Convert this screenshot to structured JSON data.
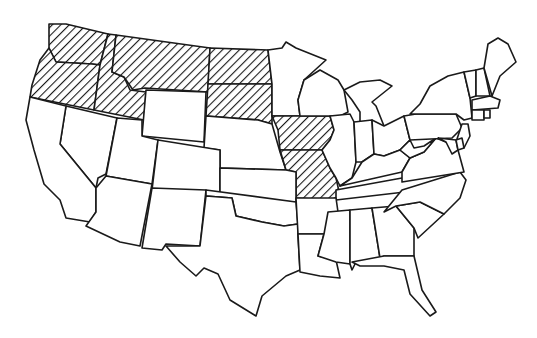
{
  "map": {
    "title": "United States map with highlighted states",
    "colors": {
      "background": "#ffffff",
      "border": "#1a1a1a",
      "hatch": "#1a1a1a",
      "fill": "#ffffff"
    },
    "pattern": "diagonal-hatch",
    "highlighted_states": [
      "WA",
      "OR",
      "ID",
      "MT",
      "ND",
      "SD",
      "IA",
      "MO"
    ],
    "states": [
      {
        "id": "WA",
        "name": "Washington",
        "points": "49,24 66,24 108,34 100,65 92,64 56,62 49,48"
      },
      {
        "id": "OR",
        "name": "Oregon",
        "points": "49,48 56,62 92,64 100,65 98,80 94,110 30,97 32,85 40,60"
      },
      {
        "id": "ID",
        "name": "Idaho",
        "points": "108,34 116,35 112,72 124,77 130,90 146,92 144,120 94,110 98,80 100,65"
      },
      {
        "id": "MT",
        "name": "Montana",
        "points": "116,35 210,48 208,92 145,88 133,90 124,77 112,72"
      },
      {
        "id": "ND",
        "name": "North Dakota",
        "points": "210,48 268,50 272,84 208,84"
      },
      {
        "id": "SD",
        "name": "South Dakota",
        "points": "208,84 272,84 272,124 258,120 206,116"
      },
      {
        "id": "WY",
        "name": "Wyoming",
        "points": "146,90 206,92 204,142 142,136"
      },
      {
        "id": "NE",
        "name": "Nebraska",
        "points": "206,116 258,120 272,124 280,152 286,170 220,168 220,150 204,148"
      },
      {
        "id": "MN",
        "name": "Minnesota",
        "points": "268,50 282,48 286,42 296,48 326,60 304,80 298,100 300,116 272,116 272,84"
      },
      {
        "id": "IA",
        "name": "Iowa",
        "points": "272,116 330,116 334,130 330,140 322,150 280,150 278,130"
      },
      {
        "id": "MO",
        "name": "Missouri",
        "points": "280,150 322,150 330,168 336,178 340,196 330,200 296,198 296,172 286,170"
      },
      {
        "id": "WI",
        "name": "Wisconsin",
        "points": "304,80 320,70 338,80 344,90 348,112 340,116 330,116 300,116 298,100"
      },
      {
        "id": "IL",
        "name": "Illinois",
        "points": "330,116 350,114 354,122 356,162 352,178 340,186 336,178 330,168 322,150 330,140 334,130"
      },
      {
        "id": "MI",
        "name": "Michigan",
        "points": "344,90 360,82 380,80 392,86 372,102 376,106 384,126 360,128 360,112 352,100"
      },
      {
        "id": "IN",
        "name": "Indiana",
        "points": "354,122 372,120 374,154 362,162 356,162"
      },
      {
        "id": "OH",
        "name": "Ohio",
        "points": "372,120 384,126 404,116 410,140 400,150 384,156 374,154"
      },
      {
        "id": "KY",
        "name": "Kentucky",
        "points": "352,178 362,162 374,154 384,156 400,150 410,158 402,172 340,186"
      },
      {
        "id": "TN",
        "name": "Tennessee",
        "points": "336,190 402,178 460,172 446,180 422,190 336,200"
      },
      {
        "id": "NV",
        "name": "Nevada",
        "points": "66,106 117,118 106,174 98,178 96,188 60,144"
      },
      {
        "id": "CA",
        "name": "California",
        "points": "30,97 66,106 60,144 96,188 96,212 90,222 66,218 60,200 44,184 34,150 26,120"
      },
      {
        "id": "UT",
        "name": "Utah",
        "points": "117,118 142,120 142,136 158,140 152,184 106,176"
      },
      {
        "id": "CO",
        "name": "Colorado",
        "points": "158,140 220,150 220,196 152,190"
      },
      {
        "id": "AZ",
        "name": "Arizona",
        "points": "106,176 152,184 140,246 120,242 86,226 96,212 96,188"
      },
      {
        "id": "NM",
        "name": "New Mexico",
        "points": "152,188 206,190 200,246 166,244 162,250 142,248"
      },
      {
        "id": "KS",
        "name": "Kansas",
        "points": "220,168 286,170 296,172 296,202 220,198"
      },
      {
        "id": "OK",
        "name": "Oklahoma",
        "points": "206,190 296,202 298,224 284,226 262,222 236,216 232,198 206,196"
      },
      {
        "id": "TX",
        "name": "Texas",
        "points": "206,196 232,198 236,216 262,222 284,226 298,224 298,236 300,270 286,276 262,296 256,316 230,300 218,274 204,268 196,276 180,262 166,246 200,246"
      },
      {
        "id": "AR",
        "name": "Arkansas",
        "points": "296,198 336,198 338,212 328,232 324,234 298,234"
      },
      {
        "id": "LA",
        "name": "Louisiana",
        "points": "298,234 324,234 318,256 336,260 340,278 320,276 300,272"
      },
      {
        "id": "MS",
        "name": "Mississippi",
        "points": "328,212 350,210 350,264 336,262 318,256 324,234"
      },
      {
        "id": "AL",
        "name": "Alabama",
        "points": "350,210 372,208 380,258 356,262 352,270 350,264"
      },
      {
        "id": "GA",
        "name": "Georgia",
        "points": "372,208 396,206 414,228 414,256 384,256 380,258"
      },
      {
        "id": "FL",
        "name": "Florida",
        "points": "352,262 384,256 414,256 422,290 436,312 430,316 410,294 404,270 384,266 360,266"
      },
      {
        "id": "SC",
        "name": "South Carolina",
        "points": "396,206 420,202 444,214 418,238 414,228"
      },
      {
        "id": "NC",
        "name": "North Carolina",
        "points": "402,190 460,172 466,180 460,198 444,214 420,202 396,206 384,212"
      },
      {
        "id": "VA",
        "name": "Virginia",
        "points": "402,172 410,158 424,152 436,138 446,142 458,150 464,172 402,182"
      },
      {
        "id": "WV",
        "name": "West Virginia",
        "points": "400,150 410,140 414,148 424,146 436,138 424,152 410,158"
      },
      {
        "id": "PA",
        "name": "Pennsylvania",
        "points": "404,116 416,114 456,114 462,128 452,138 410,140"
      },
      {
        "id": "NY",
        "name": "New York",
        "points": "410,114 420,104 430,86 448,76 464,72 470,98 472,118 464,120 456,114 416,114"
      },
      {
        "id": "NJ",
        "name": "New Jersey",
        "points": "462,124 468,124 470,136 464,148 456,142"
      },
      {
        "id": "MD",
        "name": "Maryland",
        "points": "438,138 456,140 458,150 452,154 446,142"
      },
      {
        "id": "DE",
        "name": "Delaware",
        "points": "456,140 462,138 464,148 458,150"
      },
      {
        "id": "VT",
        "name": "Vermont",
        "points": "464,72 476,70 476,96 470,98"
      },
      {
        "id": "NH",
        "name": "New Hampshire",
        "points": "476,70 484,68 490,96 476,96"
      },
      {
        "id": "MA",
        "name": "Massachusetts",
        "points": "472,100 490,96 500,100 498,108 472,110"
      },
      {
        "id": "CT",
        "name": "Connecticut",
        "points": "472,110 484,110 484,120 472,120"
      },
      {
        "id": "RI",
        "name": "Rhode Island",
        "points": "484,110 490,110 490,118 484,118"
      },
      {
        "id": "ME",
        "name": "Maine",
        "points": "484,68 488,44 498,38 508,44 516,62 500,76 492,96"
      }
    ]
  }
}
